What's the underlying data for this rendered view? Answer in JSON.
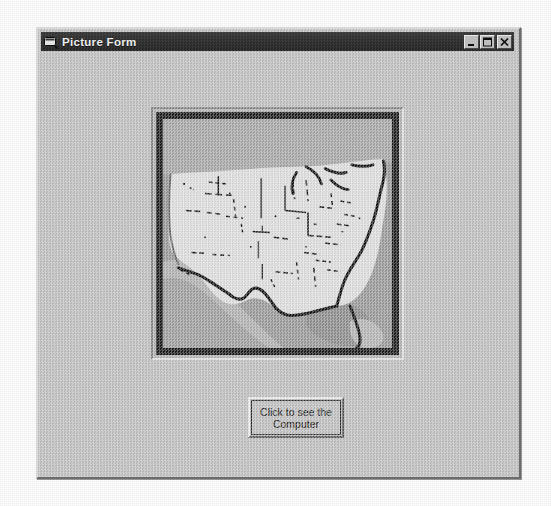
{
  "window": {
    "title": "Picture Form",
    "icon": "vb-form-icon",
    "caption_buttons": [
      {
        "name": "minimize",
        "glyph": "_"
      },
      {
        "name": "maximize",
        "glyph": "□"
      },
      {
        "name": "close",
        "glyph": "✕"
      }
    ]
  },
  "picture_box": {
    "name": "picture-box",
    "image_alt": "Map of the United States"
  },
  "button": {
    "label": "Click to see the\nComputer"
  },
  "colors": {
    "form_face": "#c3c3c3",
    "titlebar": "#2c2c2c",
    "titlebar_text": "#f2f2f2",
    "picture_frame": "#1c1c1c",
    "map_land": "#e2e2e2",
    "map_water": "#9d9d9d",
    "map_outline": "#141414",
    "button_face": "#c3c3c3",
    "button_text": "#101010"
  }
}
